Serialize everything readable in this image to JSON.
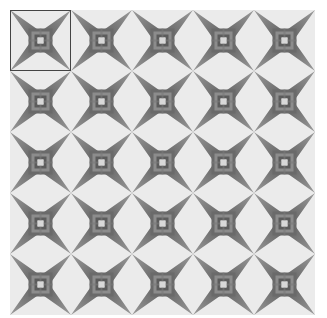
{
  "pattern": {
    "rows": 5,
    "cols": 5,
    "motif": "four-pointed-star",
    "colors": {
      "background": "#ebebeb",
      "star_dark": "#5a5a5a",
      "star_light": "#9a9a9a",
      "center_light": "#d8d8d8",
      "selection_border": "#444444"
    }
  },
  "selection": {
    "row": 0,
    "col": 0
  }
}
